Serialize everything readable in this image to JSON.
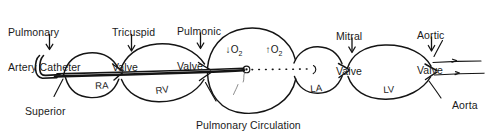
{
  "figure": {
    "caption": "Pulmonary Circulation",
    "ink_color": "#141414",
    "background_color": "#ffffff"
  },
  "callouts": [
    {
      "id": "pulmonary-artery-catheter",
      "line1": "Pulmonary",
      "line2": "Artery Catheter",
      "arrow": "down"
    },
    {
      "id": "tricuspid-valve",
      "line1": "Tricuspid",
      "line2": "Valve",
      "arrow": "down"
    },
    {
      "id": "pulmonic-valve",
      "line1": "Pulmonic",
      "line2": "Valve",
      "arrow": "down"
    },
    {
      "id": "mitral-valve",
      "line1": "Mitral",
      "line2": "Valve",
      "arrow": "down"
    },
    {
      "id": "aortic-valve",
      "line1": "Aortic",
      "line2": "Valve",
      "arrow": "down"
    }
  ],
  "vessels": [
    {
      "id": "superior-vena-cava",
      "line1": "Superior",
      "line2": "Vena Cava"
    },
    {
      "id": "aorta",
      "line1": "Aorta"
    }
  ],
  "chambers": [
    {
      "id": "right-atrium",
      "label": "RA"
    },
    {
      "id": "right-ventricle",
      "label": "RV"
    },
    {
      "id": "left-atrium",
      "label": "LA"
    },
    {
      "id": "left-ventricle",
      "label": "LV"
    }
  ],
  "gas_exchange": [
    {
      "id": "oxygen-decrease",
      "arrow": "↓",
      "gas": "O",
      "subscript": "2"
    },
    {
      "id": "oxygen-increase",
      "arrow": "↑",
      "gas": "O",
      "subscript": "2"
    }
  ],
  "arrow_glyph": "↓"
}
